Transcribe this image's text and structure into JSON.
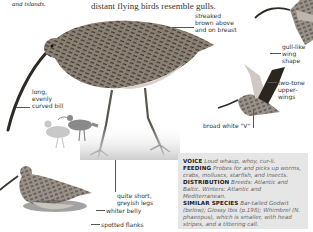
{
  "intro": {
    "left_fragment": "and islands.",
    "right_fragment": "distant flying birds resemble gulls."
  },
  "labels": {
    "streaked": "streaked brown above and on breast",
    "bill": "long, evenly curved bill",
    "gull_wing": "gull-like wing shape",
    "two_tone": "two-tone upper-wings",
    "broad_v": "broad white \"V\"",
    "legs": "quite short, greyish legs",
    "belly": "whiter belly",
    "flanks": "spotted flanks"
  },
  "info": {
    "voice_head": "VOICE",
    "voice": "Loud whaup, whoy, cur-li.",
    "feeding_head": "FEEDING",
    "feeding": "Probes for and picks up worms, crabs, molluscs, starfish, and insects.",
    "distribution_head": "DISTRIBUTION",
    "distribution": "Breeds: Atlantic and Baltic. Winters: Atlantic and Mediterranean.",
    "similar_head": "SIMILAR SPECIES",
    "similar": "Bar-tailed Godwit (below); Glossy Ibis (p.198); Whimbrel (N. phaeopus), which is smaller, with head stripes, and a tittering call."
  },
  "colors": {
    "infobox_bg": "#e6e6e6",
    "bird_dark": "#3a3530",
    "silhouette_dark": "#8a8a8a",
    "silhouette_light": "#c8c8c8"
  }
}
